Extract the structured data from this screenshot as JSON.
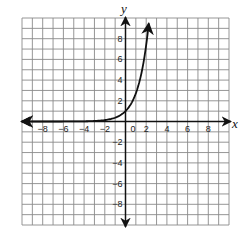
{
  "chart_data": {
    "type": "line",
    "title": "",
    "xlabel": "x",
    "ylabel": "y",
    "xlim": [
      -10,
      10
    ],
    "ylim": [
      -10,
      10
    ],
    "grid": true,
    "grid_step": 1,
    "x_tick_labels": [
      "-8",
      "-6",
      "-4",
      "-2",
      "0",
      "2",
      "4",
      "6",
      "8"
    ],
    "y_tick_labels": [
      "8",
      "6",
      "4",
      "2",
      "-2",
      "-4",
      "-6",
      "-8"
    ],
    "series": [
      {
        "name": "exponential curve",
        "description": "increasing exponential function, horizontal asymptote y=0, y-intercept 1",
        "x": [
          -10,
          -8,
          -6,
          -4,
          -3,
          -2,
          -1,
          0,
          0.5,
          1,
          1.5,
          2,
          2.25
        ],
        "y": [
          0.0,
          0.0,
          0.0,
          0.02,
          0.05,
          0.14,
          0.37,
          1,
          1.65,
          2.72,
          4.48,
          7.39,
          9.49
        ],
        "arrow_left": true,
        "arrow_right": true
      }
    ],
    "legend": null
  },
  "labels": {
    "x_axis": "x",
    "y_axis": "y",
    "origin": "0"
  }
}
